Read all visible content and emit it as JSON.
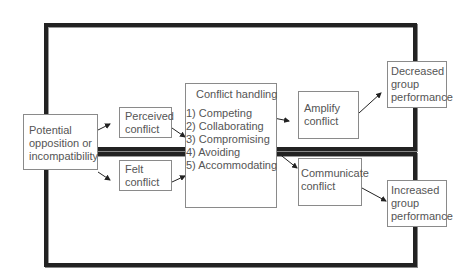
{
  "diagram": {
    "colors": {
      "frame": "#222222",
      "box_border": "#8a8a8a",
      "text": "#555555",
      "arrow": "#222222"
    },
    "nodes": {
      "potential": {
        "lines": [
          "Potential",
          "opposition or",
          "incompatibility"
        ]
      },
      "perceived": {
        "lines": [
          "Perceived",
          "conflict"
        ]
      },
      "felt": {
        "lines": [
          "Felt",
          "conflict"
        ]
      },
      "handling": {
        "title": "Conflict handling",
        "items": [
          "1) Competing",
          "2) Collaborating",
          "3) Compromising",
          "4) Avoiding",
          "5) Accommodating"
        ]
      },
      "amplify": {
        "lines": [
          "Amplify",
          "conflict"
        ]
      },
      "communicate": {
        "lines": [
          "Communicate",
          "conflict"
        ]
      },
      "decreased": {
        "lines": [
          "Decreased",
          "group",
          "performance"
        ]
      },
      "increased": {
        "lines": [
          "Increased",
          "group",
          "performance"
        ]
      }
    },
    "edges": [
      {
        "from": "potential",
        "to": "perceived"
      },
      {
        "from": "potential",
        "to": "felt"
      },
      {
        "from": "perceived",
        "to": "handling"
      },
      {
        "from": "felt",
        "to": "handling"
      },
      {
        "from": "handling.competing",
        "to": "amplify"
      },
      {
        "from": "handling.compromising",
        "to": "communicate"
      },
      {
        "from": "amplify",
        "to": "decreased"
      },
      {
        "from": "communicate",
        "to": "increased"
      }
    ]
  }
}
